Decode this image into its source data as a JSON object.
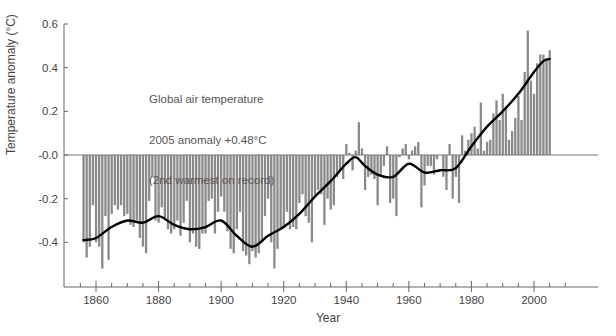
{
  "chart_data": {
    "type": "bar",
    "title": "",
    "annotation": [
      "Global air temperature",
      "2005 anomaly +0.48°C",
      "(2nd warmest on record)"
    ],
    "xlabel": "Year",
    "ylabel": "Temperature anomaly (°C)",
    "ylim": [
      -0.6,
      0.6
    ],
    "xlim": [
      1850,
      2010
    ],
    "yticks": [
      "0.6",
      "0.4",
      "0.2",
      "-0.0",
      "-0.2",
      "-0.4"
    ],
    "ytick_values": [
      0.6,
      0.4,
      0.2,
      0.0,
      -0.2,
      -0.4
    ],
    "xticks": [
      "1860",
      "1880",
      "1900",
      "1920",
      "1940",
      "1960",
      "1980",
      "2000"
    ],
    "grid": false,
    "legend": null,
    "colors": {
      "bars": "#8a8a8a",
      "smooth": "#000000",
      "axis": "#666666"
    },
    "series": [
      {
        "name": "Annual anomaly",
        "type": "bar",
        "x": [
          1856,
          1857,
          1858,
          1859,
          1860,
          1861,
          1862,
          1863,
          1864,
          1865,
          1866,
          1867,
          1868,
          1869,
          1870,
          1871,
          1872,
          1873,
          1874,
          1875,
          1876,
          1877,
          1878,
          1879,
          1880,
          1881,
          1882,
          1883,
          1884,
          1885,
          1886,
          1887,
          1888,
          1889,
          1890,
          1891,
          1892,
          1893,
          1894,
          1895,
          1896,
          1897,
          1898,
          1899,
          1900,
          1901,
          1902,
          1903,
          1904,
          1905,
          1906,
          1907,
          1908,
          1909,
          1910,
          1911,
          1912,
          1913,
          1914,
          1915,
          1916,
          1917,
          1918,
          1919,
          1920,
          1921,
          1922,
          1923,
          1924,
          1925,
          1926,
          1927,
          1928,
          1929,
          1930,
          1931,
          1932,
          1933,
          1934,
          1935,
          1936,
          1937,
          1938,
          1939,
          1940,
          1941,
          1942,
          1943,
          1944,
          1945,
          1946,
          1947,
          1948,
          1949,
          1950,
          1951,
          1952,
          1953,
          1954,
          1955,
          1956,
          1957,
          1958,
          1959,
          1960,
          1961,
          1962,
          1963,
          1964,
          1965,
          1966,
          1967,
          1968,
          1969,
          1970,
          1971,
          1972,
          1973,
          1974,
          1975,
          1976,
          1977,
          1978,
          1979,
          1980,
          1981,
          1982,
          1983,
          1984,
          1985,
          1986,
          1987,
          1988,
          1989,
          1990,
          1991,
          1992,
          1993,
          1994,
          1995,
          1996,
          1997,
          1998,
          1999,
          2000,
          2001,
          2002,
          2003,
          2004,
          2005
        ],
        "values": [
          -0.4,
          -0.47,
          -0.42,
          -0.23,
          -0.4,
          -0.42,
          -0.52,
          -0.28,
          -0.48,
          -0.27,
          -0.23,
          -0.25,
          -0.23,
          -0.28,
          -0.27,
          -0.32,
          -0.33,
          -0.3,
          -0.38,
          -0.42,
          -0.45,
          -0.21,
          -0.1,
          -0.3,
          -0.31,
          -0.24,
          -0.3,
          -0.34,
          -0.36,
          -0.34,
          -0.3,
          -0.37,
          -0.31,
          -0.21,
          -0.4,
          -0.36,
          -0.42,
          -0.43,
          -0.36,
          -0.36,
          -0.21,
          -0.2,
          -0.36,
          -0.26,
          -0.19,
          -0.26,
          -0.35,
          -0.43,
          -0.45,
          -0.34,
          -0.26,
          -0.44,
          -0.46,
          -0.5,
          -0.44,
          -0.47,
          -0.45,
          -0.4,
          -0.28,
          -0.2,
          -0.4,
          -0.52,
          -0.43,
          -0.34,
          -0.33,
          -0.26,
          -0.34,
          -0.33,
          -0.34,
          -0.22,
          -0.18,
          -0.28,
          -0.31,
          -0.4,
          -0.19,
          -0.16,
          -0.18,
          -0.32,
          -0.2,
          -0.25,
          -0.23,
          -0.1,
          -0.07,
          -0.11,
          0.05,
          0.01,
          -0.07,
          0.02,
          0.15,
          0.03,
          -0.16,
          -0.1,
          -0.09,
          -0.11,
          -0.23,
          -0.1,
          -0.05,
          0.04,
          -0.22,
          -0.2,
          -0.28,
          -0.01,
          0.03,
          0.05,
          -0.02,
          0.02,
          0.04,
          0.06,
          -0.24,
          -0.14,
          -0.05,
          -0.05,
          -0.09,
          -0.02,
          0.0,
          -0.1,
          -0.16,
          0.05,
          -0.2,
          -0.1,
          -0.22,
          0.09,
          0.02,
          0.07,
          0.1,
          0.13,
          0.03,
          0.24,
          0.02,
          0.06,
          0.07,
          0.19,
          0.25,
          0.16,
          0.28,
          0.22,
          0.07,
          0.11,
          0.17,
          0.27,
          0.16,
          0.38,
          0.57,
          0.34,
          0.28,
          0.42,
          0.46,
          0.46,
          0.44,
          0.48
        ]
      },
      {
        "name": "Smoothed trend",
        "type": "line",
        "x": [
          1856,
          1860,
          1865,
          1870,
          1875,
          1880,
          1885,
          1890,
          1895,
          1900,
          1905,
          1910,
          1915,
          1920,
          1925,
          1930,
          1935,
          1940,
          1943,
          1946,
          1950,
          1955,
          1960,
          1965,
          1970,
          1975,
          1980,
          1985,
          1990,
          1995,
          2000,
          2003,
          2005
        ],
        "values": [
          -0.39,
          -0.38,
          -0.33,
          -0.3,
          -0.31,
          -0.28,
          -0.32,
          -0.34,
          -0.33,
          -0.3,
          -0.37,
          -0.42,
          -0.37,
          -0.33,
          -0.27,
          -0.19,
          -0.12,
          -0.04,
          -0.01,
          -0.05,
          -0.09,
          -0.1,
          -0.04,
          -0.08,
          -0.07,
          -0.06,
          0.04,
          0.13,
          0.2,
          0.28,
          0.38,
          0.43,
          0.44
        ]
      }
    ]
  }
}
